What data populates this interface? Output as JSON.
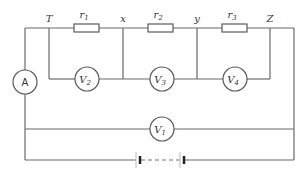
{
  "diagram": {
    "type": "circuit",
    "nodes": {
      "T": "T",
      "x": "x",
      "y": "y",
      "Z": "Z"
    },
    "resistors": [
      {
        "id": "r1",
        "label": "r",
        "sub": "1"
      },
      {
        "id": "r2",
        "label": "r",
        "sub": "2"
      },
      {
        "id": "r3",
        "label": "r",
        "sub": "3"
      }
    ],
    "ammeter": {
      "label": "A"
    },
    "voltmeters": [
      {
        "id": "V1",
        "label": "V",
        "sub": "1"
      },
      {
        "id": "V2",
        "label": "V",
        "sub": "2"
      },
      {
        "id": "V3",
        "label": "V",
        "sub": "3"
      },
      {
        "id": "V4",
        "label": "V",
        "sub": "4"
      }
    ],
    "battery": {
      "label": "battery of cells"
    }
  }
}
